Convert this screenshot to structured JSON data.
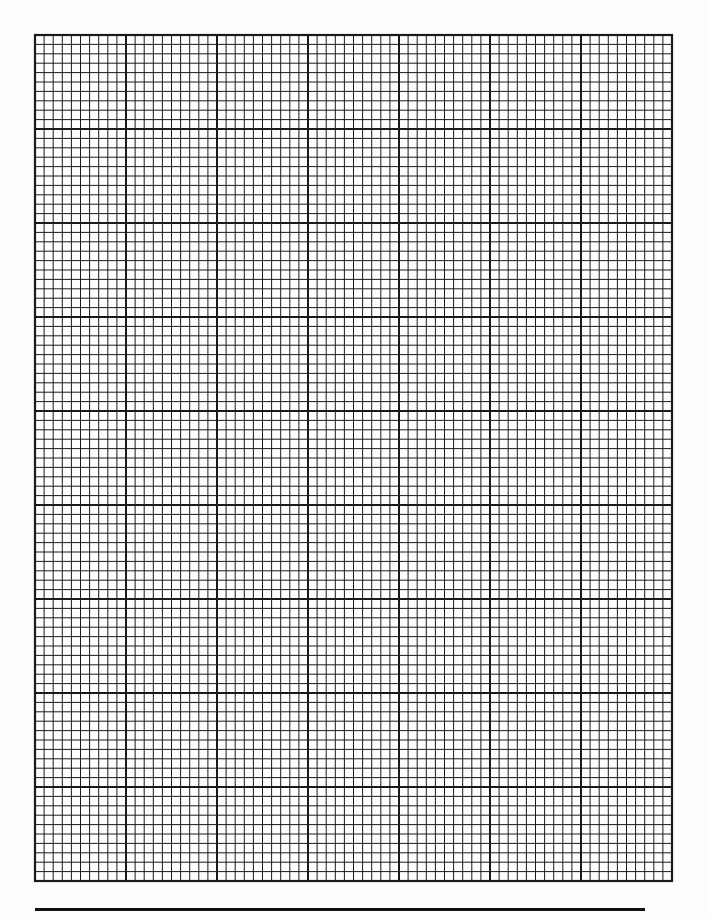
{
  "page": {
    "type": "graph-paper",
    "background_color": "#fdfdfd",
    "line_color": "#1a1a1a"
  },
  "grid": {
    "left": 35,
    "top": 35,
    "right": 672,
    "bottom": 881,
    "columns": 70,
    "rows": 90,
    "major_every": 10,
    "minor_stroke_width": 1,
    "major_stroke_width": 2,
    "border_stroke_width": 2.2
  },
  "underline": {
    "x1": 35,
    "x2": 645,
    "y": 909
  }
}
